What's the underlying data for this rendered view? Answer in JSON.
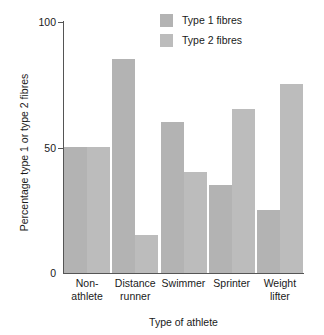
{
  "chart_data": {
    "type": "bar",
    "title": "",
    "xlabel": "Type of athlete",
    "ylabel": "Percentage type 1 or type 2 fibres",
    "categories": [
      "Non-athlete",
      "Distance runner",
      "Swimmer",
      "Sprinter",
      "Weight lifter"
    ],
    "category_lines": [
      [
        "Non-",
        "athlete"
      ],
      [
        "Distance",
        "runner"
      ],
      [
        "Swimmer",
        ""
      ],
      [
        "Sprinter",
        ""
      ],
      [
        "Weight",
        "lifter"
      ]
    ],
    "series": [
      {
        "name": "Type 1 fibres",
        "color": "#b3b3b3",
        "values": [
          50,
          85,
          60,
          35,
          25
        ]
      },
      {
        "name": "Type 2 fibres",
        "color": "#bcbcbc",
        "values": [
          50,
          15,
          40,
          65,
          75
        ]
      }
    ],
    "ylim": [
      0,
      100
    ],
    "yticks": [
      0,
      50,
      100
    ],
    "ytick_labels": [
      "0",
      "50",
      "100"
    ],
    "grid": false,
    "legend_position": "top-right",
    "legend": [
      {
        "label": "Type 1 fibres",
        "color": "#b3b3b3"
      },
      {
        "label": "Type 2 fibres",
        "color": "#bcbcbc"
      }
    ]
  },
  "legend": {
    "items": [
      {
        "label": "Type 1 fibres"
      },
      {
        "label": "Type 2 fibres"
      }
    ]
  },
  "axes": {
    "y_title": "Percentage type 1 or type 2 fibres",
    "x_title": "Type of athlete",
    "y_ticks": [
      {
        "label": "100"
      },
      {
        "label": "50"
      },
      {
        "label": "0"
      }
    ]
  },
  "x_categories": [
    {
      "line1": "Non-",
      "line2": "athlete"
    },
    {
      "line1": "Distance",
      "line2": "runner"
    },
    {
      "line1": "Swimmer",
      "line2": ""
    },
    {
      "line1": "Sprinter",
      "line2": ""
    },
    {
      "line1": "Weight",
      "line2": "lifter"
    }
  ]
}
